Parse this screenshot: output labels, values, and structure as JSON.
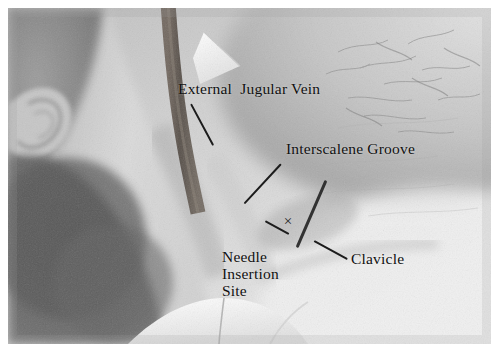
{
  "figure": {
    "kind": "clinical-photograph",
    "border_color": "#ffffff",
    "ink_color": "#1c1c1c"
  },
  "annotations": [
    {
      "id": "external-jugular-vein",
      "label": "External  Jugular Vein",
      "label_x": 178,
      "label_y": 80,
      "leader": {
        "x1": 191,
        "y1": 103,
        "x2": 213,
        "y2": 144
      }
    },
    {
      "id": "interscalene-groove",
      "label": "Interscalene Groove",
      "label_x": 286,
      "label_y": 140,
      "leader": {
        "x1": 281,
        "y1": 163,
        "x2": 244,
        "y2": 203
      }
    },
    {
      "id": "needle-insertion-site",
      "label": "Needle\nInsertion\nSite",
      "label_x": 222,
      "label_y": 248,
      "leader": {
        "x1": 289,
        "y1": 233,
        "x2": 265,
        "y2": 246
      }
    },
    {
      "id": "clavicle",
      "label": "Clavicle",
      "label_x": 351,
      "label_y": 250,
      "leader": {
        "x1": 314,
        "y1": 240,
        "x2": 347,
        "y2": 258
      }
    }
  ],
  "skin_markings": [
    {
      "id": "interscalene-groove-skin-line",
      "x1": 326,
      "y1": 179,
      "x2": 297,
      "y2": 246
    }
  ],
  "insertion_mark": {
    "id": "needle-insertion-x",
    "glyph": "×",
    "x": 281,
    "y": 214
  },
  "palette": {
    "paper": "#ffffff",
    "skin_light": "#dcdcdc",
    "skin_mid": "#b4b4b4",
    "skin_shadow": "#7a7a7a",
    "hair_dark": "#4a4a4a",
    "drape_white": "#f4f4f4",
    "strap_dark": "#5a5147"
  }
}
